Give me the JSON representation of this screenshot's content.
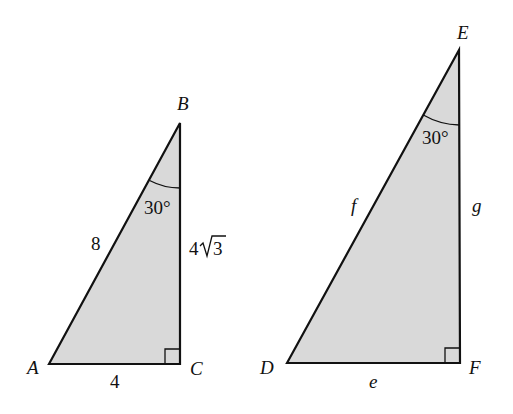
{
  "colors": {
    "fill": "#d9d9d9",
    "stroke": "#111111",
    "background": "#ffffff"
  },
  "triangle_abc": {
    "vertices": {
      "A": {
        "label": "A",
        "x": 49,
        "y": 364
      },
      "B": {
        "label": "B",
        "x": 180,
        "y": 123
      },
      "C": {
        "label": "C",
        "x": 180,
        "y": 364
      }
    },
    "sides": {
      "hypotenuse_AB": "8",
      "leg_BC_coef": "4",
      "leg_BC_radicand": "3",
      "leg_AC": "4"
    },
    "angle_B": "30°",
    "right_angle_at": "C"
  },
  "triangle_def": {
    "vertices": {
      "D": {
        "label": "D",
        "x": 287,
        "y": 363
      },
      "E": {
        "label": "E",
        "x": 459,
        "y": 50
      },
      "F": {
        "label": "F",
        "x": 460,
        "y": 363
      }
    },
    "sides": {
      "hypotenuse_DE": "f",
      "leg_EF": "g",
      "leg_DF": "e"
    },
    "angle_E": "30°",
    "right_angle_at": "F"
  }
}
